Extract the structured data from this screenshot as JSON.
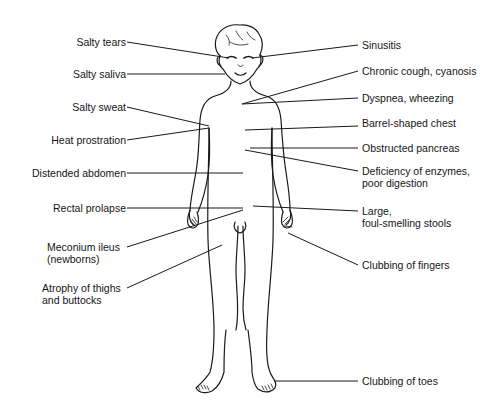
{
  "diagram": {
    "labels_left": [
      {
        "id": "salty-tears",
        "lines": [
          "Salty tears"
        ]
      },
      {
        "id": "salty-saliva",
        "lines": [
          "Salty saliva"
        ]
      },
      {
        "id": "salty-sweat",
        "lines": [
          "Salty sweat"
        ]
      },
      {
        "id": "heat-prostration",
        "lines": [
          "Heat prostration"
        ]
      },
      {
        "id": "distended-abdomen",
        "lines": [
          "Distended abdomen"
        ]
      },
      {
        "id": "rectal-prolapse",
        "lines": [
          "Rectal prolapse"
        ]
      },
      {
        "id": "meconium-ileus",
        "lines": [
          "Meconium ileus",
          "(newborns)"
        ]
      },
      {
        "id": "atrophy-thighs",
        "lines": [
          "Atrophy of thighs",
          "and buttocks"
        ]
      }
    ],
    "labels_right": [
      {
        "id": "sinusitis",
        "lines": [
          "Sinusitis"
        ]
      },
      {
        "id": "chronic-cough",
        "lines": [
          "Chronic cough, cyanosis"
        ]
      },
      {
        "id": "dyspnea",
        "lines": [
          "Dyspnea, wheezing"
        ]
      },
      {
        "id": "barrel-chest",
        "lines": [
          "Barrel-shaped chest"
        ]
      },
      {
        "id": "obstructed-pancreas",
        "lines": [
          "Obstructed pancreas"
        ]
      },
      {
        "id": "enzyme-deficiency",
        "lines": [
          "Deficiency of enzymes,",
          "poor digestion"
        ]
      },
      {
        "id": "stools",
        "lines": [
          "Large,",
          "foul-smelling stools"
        ]
      },
      {
        "id": "clubbing-fingers",
        "lines": [
          "Clubbing of fingers"
        ]
      },
      {
        "id": "clubbing-toes",
        "lines": [
          "Clubbing of toes"
        ]
      }
    ]
  }
}
